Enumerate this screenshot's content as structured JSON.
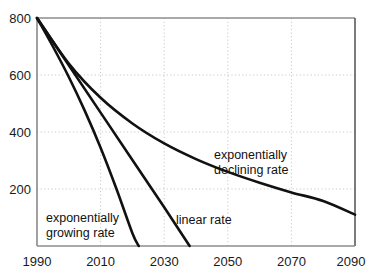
{
  "chart_data": {
    "type": "line",
    "title": "",
    "subtitle": "",
    "xlabel": "",
    "ylabel": "",
    "xlim": [
      1990,
      2090
    ],
    "ylim": [
      0,
      800
    ],
    "xticks": [
      "1990",
      "2010",
      "2030",
      "2050",
      "2070",
      "2090"
    ],
    "xtick_values": [
      1990,
      2010,
      2030,
      2050,
      2070,
      2090
    ],
    "yticks": [
      "200",
      "400",
      "600",
      "800"
    ],
    "ytick_values": [
      200,
      400,
      600,
      800
    ],
    "grid": "dotted-light-gray-both-axes",
    "legend": "inline-annotations",
    "series": [
      {
        "name": "exponentially growing rate",
        "x": [
          1990,
          1995,
          2000,
          2005,
          2010,
          2015,
          2020,
          2022
        ],
        "values": [
          800,
          700,
          593,
          475,
          345,
          200,
          45,
          0
        ]
      },
      {
        "name": "linear rate",
        "x": [
          1990,
          2000,
          2010,
          2020,
          2030,
          2038
        ],
        "values": [
          800,
          634,
          468,
          302,
          136,
          0
        ]
      },
      {
        "name": "exponentially declining rate",
        "x": [
          1990,
          2000,
          2010,
          2020,
          2030,
          2040,
          2050,
          2060,
          2070,
          2080,
          2090
        ],
        "values": [
          800,
          640,
          520,
          430,
          360,
          305,
          260,
          222,
          188,
          158,
          110
        ]
      }
    ],
    "annotations": [
      {
        "id": "annotation-growing",
        "lines": [
          "exponentially",
          "growing rate"
        ],
        "x": 1997,
        "y": 105
      },
      {
        "id": "annotation-linear",
        "lines": [
          "linear rate"
        ],
        "x": 2036,
        "y": 100
      },
      {
        "id": "annotation-declining",
        "lines": [
          "exponentially",
          "declining rate"
        ],
        "x": 2046,
        "y": 330
      }
    ],
    "colors": {
      "curve": "#111111",
      "grid": "#c8c8c8",
      "axis": "#808080",
      "axis_dark": "#555555",
      "background": "#ffffff",
      "text": "#1a1a1a"
    }
  }
}
